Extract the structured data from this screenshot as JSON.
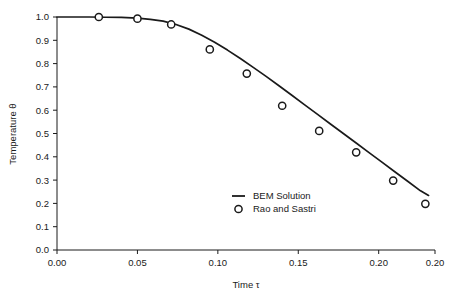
{
  "chart_data": {
    "type": "line",
    "title": "",
    "subtitle": "",
    "xlabel": "Time τ",
    "ylabel": "Temperature θ",
    "xlim": [
      0.0,
      0.235
    ],
    "ylim": [
      0.0,
      1.0
    ],
    "grid": false,
    "legend_position": "inside-lower-right",
    "x_ticks": [
      0.0,
      0.05,
      0.1,
      0.15,
      0.2,
      0.235
    ],
    "x_tick_labels": [
      "0.00",
      "0.05",
      "0.10",
      "0.15",
      "0.20",
      "0.20"
    ],
    "y_ticks": [
      0.0,
      0.1,
      0.2,
      0.3,
      0.4,
      0.5,
      0.6,
      0.7,
      0.8,
      0.9,
      1.0
    ],
    "y_tick_labels": [
      "0.0",
      "0.1",
      "0.2",
      "0.3",
      "0.4",
      "0.5",
      "0.6",
      "0.7",
      "0.8",
      "0.9",
      "1.0"
    ],
    "series": [
      {
        "name": "BEM Solution",
        "style": "line",
        "color": "#1a1a1a",
        "x": [
          0.0,
          0.01,
          0.02,
          0.03,
          0.04,
          0.05,
          0.058,
          0.066,
          0.074,
          0.082,
          0.09,
          0.098,
          0.106,
          0.114,
          0.122,
          0.13,
          0.138,
          0.146,
          0.154,
          0.162,
          0.17,
          0.178,
          0.186,
          0.194,
          0.202,
          0.21,
          0.218,
          0.226,
          0.231
        ],
        "y": [
          1.0,
          1.0,
          1.0,
          0.999,
          0.998,
          0.995,
          0.99,
          0.982,
          0.968,
          0.948,
          0.922,
          0.892,
          0.858,
          0.822,
          0.784,
          0.745,
          0.705,
          0.664,
          0.623,
          0.582,
          0.541,
          0.5,
          0.459,
          0.418,
          0.377,
          0.336,
          0.295,
          0.254,
          0.234
        ]
      },
      {
        "name": "Rao and Sastri",
        "style": "markers",
        "marker": "open-circle",
        "color": "#1a1a1a",
        "x": [
          0.026,
          0.05,
          0.071,
          0.095,
          0.118,
          0.14,
          0.163,
          0.186,
          0.209,
          0.229
        ],
        "y": [
          1.0,
          0.993,
          0.968,
          0.861,
          0.757,
          0.619,
          0.511,
          0.419,
          0.298,
          0.198
        ]
      }
    ],
    "legend": [
      {
        "label": "BEM Solution",
        "marker": "line"
      },
      {
        "label": "Rao and Sastri",
        "marker": "open-circle"
      }
    ],
    "colors": {
      "foreground": "#1a1a1a",
      "background": "#ffffff"
    }
  }
}
